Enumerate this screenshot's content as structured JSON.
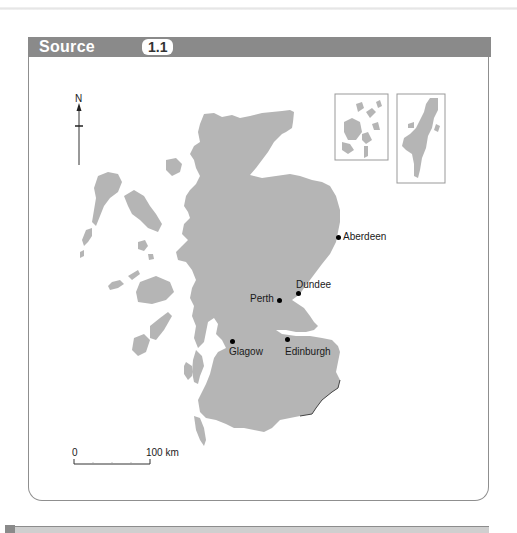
{
  "header": {
    "title": "Source",
    "badge": "1.1"
  },
  "map": {
    "subject": "Scotland",
    "north_arrow_label": "N",
    "land_color": "#b5b5b5",
    "cities": [
      {
        "name": "Aberdeen",
        "x": 338,
        "y": 237
      },
      {
        "name": "Dundee",
        "x": 298,
        "y": 293
      },
      {
        "name": "Perth",
        "x": 279,
        "y": 300
      },
      {
        "name": "Glagow",
        "x": 232,
        "y": 341
      },
      {
        "name": "Edinburgh",
        "x": 287,
        "y": 339
      }
    ],
    "insets": [
      {
        "name": "Orkney inset"
      },
      {
        "name": "Shetland inset"
      }
    ],
    "scale_bar": {
      "start_label": "0",
      "end_label": "100 km"
    }
  }
}
